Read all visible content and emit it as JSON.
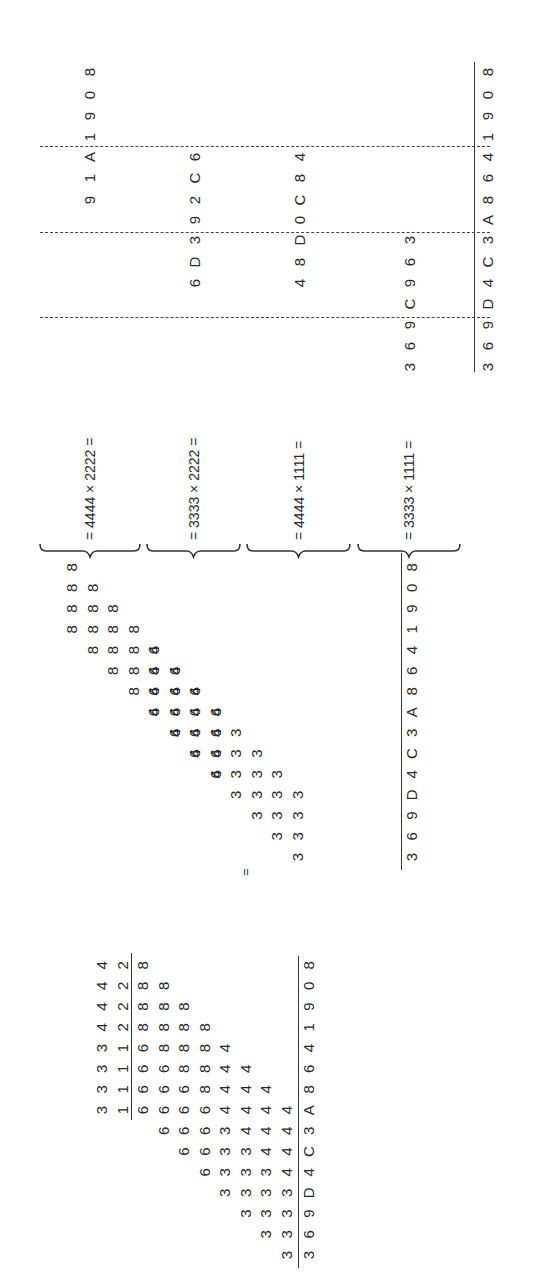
{
  "left_grid": {
    "multiplicand": [
      "3",
      "3",
      "3",
      "3",
      "4",
      "4",
      "4",
      "4"
    ],
    "multiplier": [
      "1",
      "1",
      "1",
      "1",
      "2",
      "2",
      "2",
      "2"
    ],
    "partial_rows": [
      {
        "shift": 0,
        "digits": [
          "6",
          "6",
          "6",
          "6",
          "8",
          "8",
          "8",
          "8"
        ]
      },
      {
        "shift": 1,
        "digits": [
          "6",
          "6",
          "6",
          "6",
          "8",
          "8",
          "8",
          "8"
        ]
      },
      {
        "shift": 2,
        "digits": [
          "6",
          "6",
          "6",
          "6",
          "8",
          "8",
          "8",
          "8"
        ]
      },
      {
        "shift": 3,
        "digits": [
          "6",
          "6",
          "6",
          "6",
          "8",
          "8",
          "8",
          "8"
        ]
      },
      {
        "shift": 4,
        "digits": [
          "3",
          "3",
          "3",
          "3",
          "4",
          "4",
          "4",
          "4"
        ]
      },
      {
        "shift": 5,
        "digits": [
          "3",
          "3",
          "3",
          "3",
          "4",
          "4",
          "4",
          "4"
        ]
      },
      {
        "shift": 6,
        "digits": [
          "3",
          "3",
          "3",
          "3",
          "4",
          "4",
          "4",
          "4"
        ]
      },
      {
        "shift": 7,
        "digits": [
          "3",
          "3",
          "3",
          "3",
          "4",
          "4",
          "4",
          "4"
        ]
      }
    ],
    "result": [
      "3",
      "6",
      "9",
      "D",
      "4",
      "C",
      "3",
      "A",
      "8",
      "6",
      "4",
      "1",
      "9",
      "0",
      "8"
    ]
  },
  "equals_sign": "=",
  "middle_grid": {
    "groups": [
      {
        "digit": "8",
        "rows": [
          0,
          1,
          2,
          3
        ],
        "col_offset": 0
      },
      {
        "digit": "6",
        "rows": [
          4,
          5,
          6,
          7
        ],
        "col_offset": 4
      },
      {
        "digit": "4",
        "rows": [
          4,
          5,
          6,
          7
        ],
        "col_offset": 0
      },
      {
        "digit": "3",
        "rows": [
          8,
          9,
          10,
          11
        ],
        "col_offset": 4
      }
    ],
    "result": [
      "3",
      "6",
      "9",
      "D",
      "4",
      "C",
      "3",
      "A",
      "8",
      "6",
      "4",
      "1",
      "9",
      "0",
      "8"
    ]
  },
  "braces": [
    {
      "label": "= 4444 × 2222 ="
    },
    {
      "label": "= 3333 × 2222 ="
    },
    {
      "label": "= 4444 × 1111 ="
    },
    {
      "label": "= 3333 × 1111 ="
    }
  ],
  "partial_products": [
    {
      "digits": [
        "9",
        "1",
        "A",
        "1",
        "9",
        "0",
        "8"
      ],
      "shift": 0
    },
    {
      "digits": [
        "6",
        "D",
        "3",
        "9",
        "2",
        "C",
        "6"
      ],
      "shift": 4
    },
    {
      "digits": [
        "4",
        "8",
        "D",
        "0",
        "C",
        "8",
        "4"
      ],
      "shift": 4
    },
    {
      "digits": [
        "3",
        "6",
        "9",
        "C",
        "9",
        "6",
        "3"
      ],
      "shift": 8
    }
  ],
  "final_result": [
    "3",
    "6",
    "9",
    "D",
    "4",
    "C",
    "3",
    "A",
    "8",
    "6",
    "4",
    "1",
    "9",
    "0",
    "8"
  ]
}
